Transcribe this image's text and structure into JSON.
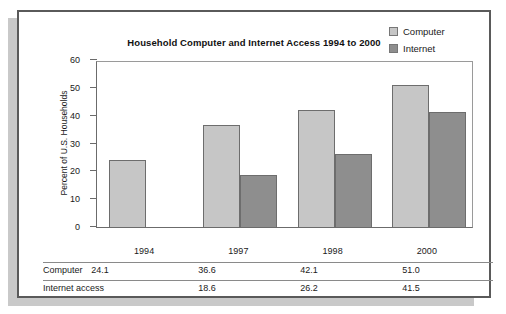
{
  "chart_data": {
    "type": "bar",
    "title": "Household Computer and Internet Access 1994 to 2000",
    "xlabel": "",
    "ylabel": "Percent of U.S. Households",
    "ylim": [
      0,
      60
    ],
    "ytick_labels": [
      "0",
      "10",
      "20",
      "30",
      "40",
      "50",
      "60"
    ],
    "ytick_values": [
      0,
      10,
      20,
      30,
      40,
      50,
      60
    ],
    "grid": false,
    "legend_position": "top-right",
    "categories": [
      "1994",
      "1997",
      "1998",
      "2000"
    ],
    "series": [
      {
        "name": "Computer",
        "color": "#c6c6c6",
        "values": [
          24.1,
          36.6,
          42.1,
          51.0
        ],
        "value_labels": [
          "24.1",
          "36.6",
          "42.1",
          "51.0"
        ]
      },
      {
        "name": "Internet",
        "color": "#8e8e8e",
        "values": [
          null,
          18.6,
          26.2,
          41.5
        ],
        "value_labels": [
          "",
          "18.6",
          "26.2",
          "41.5"
        ]
      }
    ]
  },
  "legend": {
    "items": [
      {
        "label": "Computer",
        "swatch_color": "#c6c6c6"
      },
      {
        "label": "Internet",
        "swatch_color": "#8e8e8e"
      }
    ]
  },
  "table": {
    "row_labels": [
      "Computer",
      "Internet access"
    ],
    "rows": [
      [
        "24.1",
        "36.6",
        "42.1",
        "51.0"
      ],
      [
        "",
        "18.6",
        "26.2",
        "41.5"
      ]
    ]
  },
  "colors": {
    "frame_border": "#5a5a5a",
    "shadow": "#c9c9c9",
    "axis": "#6b6b6b",
    "bar_border": "#6d6d6d",
    "computer_fill": "#c6c6c6",
    "internet_fill": "#8e8e8e",
    "text": "#1a1a1a",
    "background": "#ffffff"
  }
}
